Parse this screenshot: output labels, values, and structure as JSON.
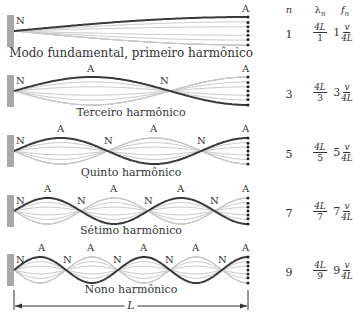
{
  "diagram": {
    "wall_color": "#a8a8a8",
    "string_color": "#3a3a3a",
    "ghost_color": "#c8c8c8",
    "length_label": "L",
    "columns": {
      "n": "n",
      "lambda": "λ",
      "lambda_sub": "n",
      "f": "f",
      "f_sub": "n"
    },
    "rows": [
      {
        "n": "1",
        "caption": "Modo fundamental, primeiro harmônico",
        "lambda_num": "4L",
        "lambda_den": "1",
        "f_coef": "1",
        "f_num": "v",
        "f_den": "4L",
        "labels": [
          {
            "t": "N",
            "x": 16,
            "y": 16
          },
          {
            "t": "A",
            "x": 242,
            "y": 4
          }
        ]
      },
      {
        "n": "3",
        "caption": "Terceiro harmônico",
        "lambda_num": "4L",
        "lambda_den": "3",
        "f_coef": "3",
        "f_num": "v",
        "f_den": "4L",
        "labels": [
          {
            "t": "N",
            "x": 16,
            "y": 76
          },
          {
            "t": "A",
            "x": 87,
            "y": 64
          },
          {
            "t": "N",
            "x": 160,
            "y": 76
          },
          {
            "t": "A",
            "x": 242,
            "y": 64
          }
        ]
      },
      {
        "n": "5",
        "caption": "Quinto harmônico",
        "lambda_num": "4L",
        "lambda_den": "5",
        "f_coef": "5",
        "f_num": "v",
        "f_den": "4L",
        "labels": [
          {
            "t": "N",
            "x": 16,
            "y": 136
          },
          {
            "t": "A",
            "x": 57,
            "y": 124
          },
          {
            "t": "N",
            "x": 104,
            "y": 136
          },
          {
            "t": "A",
            "x": 150,
            "y": 124
          },
          {
            "t": "N",
            "x": 197,
            "y": 136
          },
          {
            "t": "A",
            "x": 242,
            "y": 124
          }
        ]
      },
      {
        "n": "7",
        "caption": "Sétimo harmônico",
        "lambda_num": "4L",
        "lambda_den": "7",
        "f_coef": "7",
        "f_num": "v",
        "f_den": "4L",
        "labels": [
          {
            "t": "N",
            "x": 16,
            "y": 196
          },
          {
            "t": "A",
            "x": 44,
            "y": 184
          },
          {
            "t": "N",
            "x": 77,
            "y": 196
          },
          {
            "t": "A",
            "x": 110,
            "y": 184
          },
          {
            "t": "N",
            "x": 144,
            "y": 196
          },
          {
            "t": "A",
            "x": 177,
            "y": 184
          },
          {
            "t": "N",
            "x": 210,
            "y": 196
          },
          {
            "t": "A",
            "x": 242,
            "y": 184
          }
        ]
      },
      {
        "n": "9",
        "caption": "Nono harmônico",
        "lambda_num": "4L",
        "lambda_den": "9",
        "f_coef": "9",
        "f_num": "v",
        "f_den": "4L",
        "labels": [
          {
            "t": "N",
            "x": 16,
            "y": 255
          },
          {
            "t": "A",
            "x": 38,
            "y": 243
          },
          {
            "t": "N",
            "x": 63,
            "y": 255
          },
          {
            "t": "A",
            "x": 87,
            "y": 243
          },
          {
            "t": "N",
            "x": 113,
            "y": 255
          },
          {
            "t": "A",
            "x": 140,
            "y": 243
          },
          {
            "t": "N",
            "x": 165,
            "y": 255
          },
          {
            "t": "A",
            "x": 192,
            "y": 243
          },
          {
            "t": "N",
            "x": 218,
            "y": 255
          },
          {
            "t": "A",
            "x": 242,
            "y": 243
          }
        ]
      }
    ]
  }
}
